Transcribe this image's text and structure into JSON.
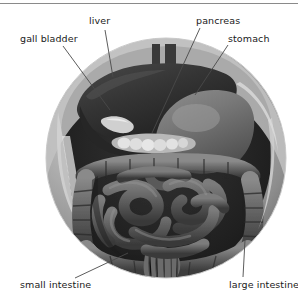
{
  "figure": {
    "view_shape": "circle",
    "background_color": "#ffffff",
    "rule_color": "#8a8a8a",
    "label_color": "#1a1a1a",
    "leader_line_color": "#4a4a4a",
    "organs": [
      {
        "key": "liver",
        "label": "liver",
        "fill_color": "#3a3a3a",
        "leader_from": [
          105,
          30
        ],
        "leader_to": [
          113,
          77
        ]
      },
      {
        "key": "gall_bladder",
        "label": "gall bladder",
        "fill_color": "#2e2e2e",
        "leader_from": [
          63,
          46
        ],
        "leader_to": [
          110,
          110
        ]
      },
      {
        "key": "pancreas",
        "label": "pancreas",
        "fill_color": "#c8c8c8",
        "leader_from": [
          200,
          28
        ],
        "leader_to": [
          152,
          133
        ]
      },
      {
        "key": "stomach",
        "label": "stomach",
        "fill_color": "#6e6e6e",
        "leader_from": [
          228,
          45
        ],
        "leader_to": [
          195,
          95
        ]
      },
      {
        "key": "small_intestine",
        "label": "small intestine",
        "fill_color": "#5a5a5a",
        "leader_from": [
          75,
          278
        ],
        "leader_to": [
          128,
          253
        ]
      },
      {
        "key": "large_intestine",
        "label": "large intestine",
        "fill_color": "#6a6a6a",
        "leader_from": [
          245,
          240
        ],
        "leader_to": [
          243,
          277
        ]
      }
    ]
  }
}
